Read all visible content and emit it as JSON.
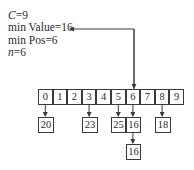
{
  "info": {
    "c_label": "C",
    "c_value": "=9",
    "min_value_text": "min Value=16",
    "min_pos_text": "min Pos=6",
    "n_label": "n",
    "n_value": "=6"
  },
  "array": {
    "indices": [
      "0",
      "1",
      "2",
      "3",
      "4",
      "5",
      "6",
      "7",
      "8",
      "9"
    ]
  },
  "buckets": [
    {
      "index": 0,
      "values": [
        "20"
      ]
    },
    {
      "index": 3,
      "values": [
        "23"
      ]
    },
    {
      "index": 5,
      "values": [
        "25"
      ]
    },
    {
      "index": 6,
      "values": [
        "16",
        "16"
      ]
    },
    {
      "index": 8,
      "values": [
        "18"
      ]
    }
  ],
  "pointer": {
    "from": "min Value",
    "to_index": 6
  },
  "colors": {
    "line": "#3a3a3a",
    "text": "#2a2a2a"
  }
}
